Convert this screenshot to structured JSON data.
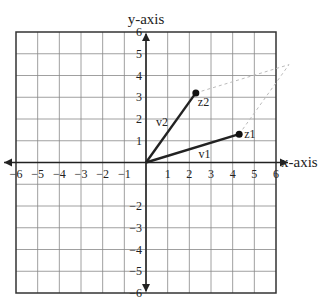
{
  "chart_data": {
    "type": "line",
    "title": "",
    "xlabel": "x-axis",
    "ylabel": "y-axis",
    "xlim": [
      -6,
      6
    ],
    "ylim": [
      -6,
      6
    ],
    "grid": true,
    "x_ticks": [
      "-6",
      "-5",
      "-4",
      "-3",
      "-2",
      "-1",
      "1",
      "2",
      "3",
      "4",
      "5",
      "6"
    ],
    "y_ticks": [
      "6",
      "5",
      "4",
      "3",
      "2",
      "1",
      "-2",
      "-3",
      "-4",
      "-5",
      "-6"
    ],
    "vectors": [
      {
        "name": "v1",
        "point_label": "z1",
        "from": [
          0,
          0
        ],
        "to": [
          4.3,
          1.3
        ]
      },
      {
        "name": "v2",
        "point_label": "z2",
        "from": [
          0,
          0
        ],
        "to": [
          2.3,
          3.2
        ]
      }
    ],
    "dashed_parallelogram_vertex": [
      6.6,
      4.5
    ]
  }
}
